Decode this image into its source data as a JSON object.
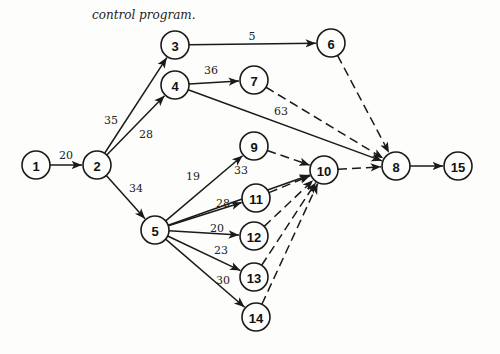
{
  "caption": "control program.",
  "nodes": [
    {
      "id": "1",
      "x": 36,
      "y": 165
    },
    {
      "id": "2",
      "x": 97,
      "y": 165
    },
    {
      "id": "3",
      "x": 175,
      "y": 45
    },
    {
      "id": "4",
      "x": 175,
      "y": 85
    },
    {
      "id": "5",
      "x": 155,
      "y": 230
    },
    {
      "id": "6",
      "x": 331,
      "y": 43
    },
    {
      "id": "7",
      "x": 254,
      "y": 80
    },
    {
      "id": "8",
      "x": 396,
      "y": 166
    },
    {
      "id": "9",
      "x": 254,
      "y": 146
    },
    {
      "id": "10",
      "x": 324,
      "y": 170
    },
    {
      "id": "11",
      "x": 256,
      "y": 198
    },
    {
      "id": "12",
      "x": 254,
      "y": 236
    },
    {
      "id": "13",
      "x": 254,
      "y": 277
    },
    {
      "id": "14",
      "x": 256,
      "y": 317
    },
    {
      "id": "15",
      "x": 458,
      "y": 166
    }
  ],
  "edges": [
    {
      "from": "1",
      "to": "2",
      "label": "20",
      "dashed": false,
      "lx": 66,
      "ly": 159
    },
    {
      "from": "2",
      "to": "3",
      "label": "35",
      "dashed": false,
      "lx": 111,
      "ly": 124
    },
    {
      "from": "2",
      "to": "4",
      "label": "28",
      "dashed": false,
      "lx": 146,
      "ly": 138
    },
    {
      "from": "2",
      "to": "5",
      "label": "34",
      "dashed": false,
      "lx": 136,
      "ly": 192
    },
    {
      "from": "3",
      "to": "6",
      "label": "5",
      "dashed": false,
      "lx": 252,
      "ly": 40
    },
    {
      "from": "4",
      "to": "7",
      "label": "36",
      "dashed": false,
      "lx": 211,
      "ly": 74
    },
    {
      "from": "4",
      "to": "8",
      "label": "63",
      "dashed": false,
      "lx": 281,
      "ly": 115
    },
    {
      "from": "5",
      "to": "9",
      "label": "19",
      "dashed": false,
      "lx": 193,
      "ly": 180
    },
    {
      "from": "5",
      "to": "10",
      "label": "33",
      "dashed": false,
      "lx": 241,
      "ly": 174
    },
    {
      "from": "5",
      "to": "11",
      "label": "28",
      "dashed": false,
      "lx": 223,
      "ly": 207
    },
    {
      "from": "5",
      "to": "12",
      "label": "20",
      "dashed": false,
      "lx": 217,
      "ly": 232
    },
    {
      "from": "5",
      "to": "13",
      "label": "23",
      "dashed": false,
      "lx": 221,
      "ly": 254
    },
    {
      "from": "5",
      "to": "14",
      "label": "30",
      "dashed": false,
      "lx": 223,
      "ly": 284
    },
    {
      "from": "6",
      "to": "8",
      "label": "",
      "dashed": true
    },
    {
      "from": "7",
      "to": "8",
      "label": "",
      "dashed": true
    },
    {
      "from": "9",
      "to": "10",
      "label": "",
      "dashed": true
    },
    {
      "from": "11",
      "to": "10",
      "label": "",
      "dashed": true
    },
    {
      "from": "12",
      "to": "10",
      "label": "",
      "dashed": true
    },
    {
      "from": "13",
      "to": "10",
      "label": "",
      "dashed": true
    },
    {
      "from": "14",
      "to": "10",
      "label": "",
      "dashed": true
    },
    {
      "from": "10",
      "to": "8",
      "label": "",
      "dashed": true
    },
    {
      "from": "8",
      "to": "15",
      "label": "",
      "dashed": false
    }
  ]
}
